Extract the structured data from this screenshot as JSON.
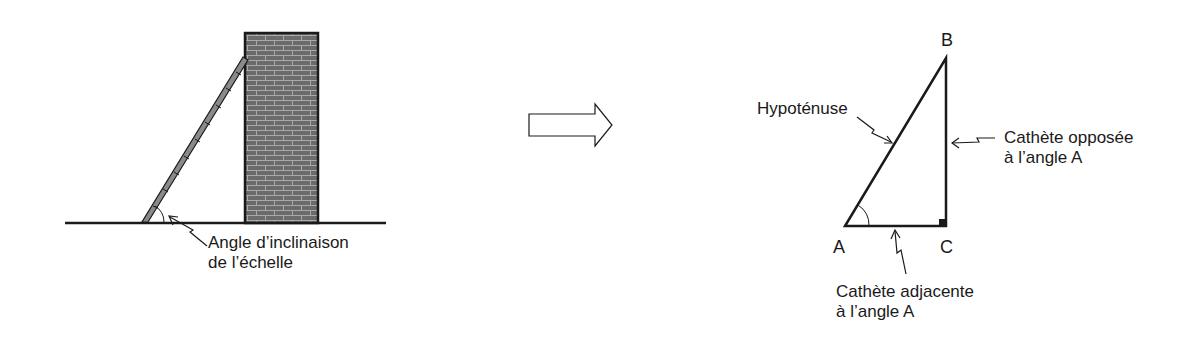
{
  "left_panel": {
    "title": "Ladder against wall",
    "angle_label": {
      "line1": "Angle d’inclinaison",
      "line2": "de l’échelle"
    }
  },
  "transition_arrow": {
    "icon": "right-arrow-outline"
  },
  "right_panel": {
    "vertices": {
      "A": "A",
      "B": "B",
      "C": "C"
    },
    "labels": {
      "hypotenuse": "Hypoténuse",
      "opposite": {
        "line1": "Cathète opposée",
        "line2": "à l’angle A"
      },
      "adjacent": {
        "line1": "Cathète adjacente",
        "line2": "à l’angle A"
      }
    }
  },
  "colors": {
    "line": "#1a1a1a",
    "brick": "#6b6b6b",
    "mortar": "#a9a9a9",
    "ladder": "#8a8a8a"
  }
}
